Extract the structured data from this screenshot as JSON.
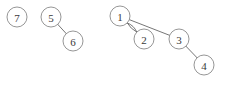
{
  "diagram": {
    "type": "node-link-graph",
    "width": 233,
    "height": 85,
    "background_color": "#ffffff",
    "node_fill_color": "#ffffff",
    "node_stroke_color": "#8a8a8a",
    "edge_color": "#666666",
    "label_color": "#3a3a3a",
    "node_radius": 10,
    "nodes": [
      {
        "id": "n7",
        "label": "7",
        "cx": 17,
        "cy": 17
      },
      {
        "id": "n5",
        "label": "5",
        "cx": 51,
        "cy": 17
      },
      {
        "id": "n6",
        "label": "6",
        "cx": 73,
        "cy": 41
      },
      {
        "id": "n1",
        "label": "1",
        "cx": 120,
        "cy": 16
      },
      {
        "id": "n2",
        "label": "2",
        "cx": 144,
        "cy": 39
      },
      {
        "id": "n3",
        "label": "3",
        "cx": 179,
        "cy": 39
      },
      {
        "id": "n4",
        "label": "4",
        "cx": 204,
        "cy": 65
      }
    ],
    "edges": [
      {
        "id": "e56",
        "source": "n5",
        "target": "n6",
        "curvature": 0,
        "multiplicity_index": 0
      },
      {
        "id": "e12a",
        "source": "n1",
        "target": "n2",
        "curvature": -3.0,
        "multiplicity_index": 0
      },
      {
        "id": "e12b",
        "source": "n1",
        "target": "n2",
        "curvature": 2.0,
        "multiplicity_index": 1
      },
      {
        "id": "e13",
        "source": "n1",
        "target": "n3",
        "curvature": 0,
        "multiplicity_index": 0
      },
      {
        "id": "e34",
        "source": "n3",
        "target": "n4",
        "curvature": 0,
        "multiplicity_index": 0
      }
    ],
    "components": [
      {
        "name": "component-isolated",
        "members": [
          "7"
        ]
      },
      {
        "name": "component-pair",
        "members": [
          "5",
          "6"
        ]
      },
      {
        "name": "component-main",
        "members": [
          "1",
          "2",
          "3",
          "4"
        ]
      }
    ]
  }
}
